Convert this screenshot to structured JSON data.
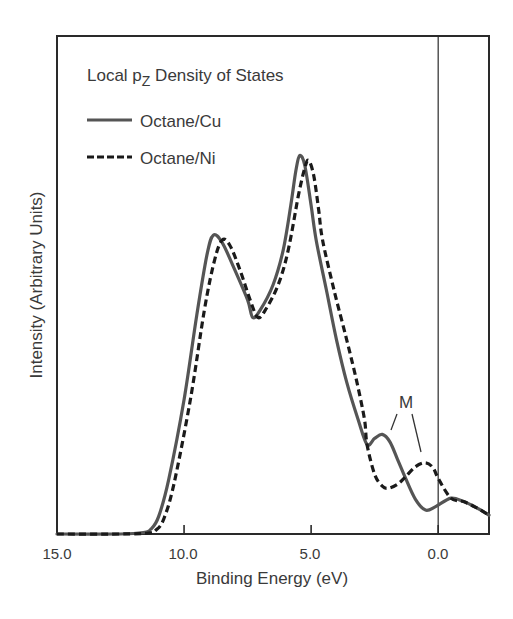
{
  "chart_data": {
    "type": "line",
    "title": "",
    "xlabel": "Binding Energy (eV)",
    "ylabel": "Intensity (Arbitrary Units)",
    "xlim": [
      15.0,
      -2.0
    ],
    "ylim": [
      0,
      100
    ],
    "x_reversed": true,
    "xticks": [
      15.0,
      10.0,
      5.0,
      0.0
    ],
    "xtick_labels": [
      "15.0",
      "10.0",
      "5.0",
      "0.0"
    ],
    "yticks": [],
    "grid": false,
    "legend": {
      "title": "Local p",
      "title_subscript": "Z",
      "title_suffix": " Density of States",
      "position": "upper left",
      "entries": [
        "Octane/Cu",
        "Octane/Ni"
      ]
    },
    "reference_lines": [
      {
        "axis": "x",
        "value": 0.0,
        "label": "Fermi level"
      }
    ],
    "annotations": [
      {
        "text": "M",
        "x": 1.6,
        "y": 27,
        "points_to": [
          {
            "x": 2.2,
            "y": 20
          },
          {
            "x": 0.5,
            "y": 14
          }
        ]
      }
    ],
    "series": [
      {
        "name": "Octane/Cu",
        "style": "solid",
        "color": "#555555",
        "x": [
          15.0,
          12.5,
          11.6,
          11.3,
          11.0,
          10.6,
          10.0,
          9.5,
          9.1,
          8.85,
          8.5,
          8.0,
          7.5,
          7.3,
          7.0,
          6.5,
          6.1,
          5.8,
          5.6,
          5.45,
          5.25,
          5.0,
          4.8,
          4.4,
          4.0,
          3.6,
          3.15,
          2.8,
          2.5,
          2.2,
          1.9,
          1.6,
          1.3,
          0.9,
          0.5,
          0.1,
          -0.5,
          -1.0,
          -1.5,
          -2.0
        ],
        "y": [
          0.0,
          0.0,
          0.3,
          1.0,
          3.5,
          11.0,
          27.0,
          44.0,
          56.0,
          60.0,
          58.5,
          53.0,
          47.0,
          43.5,
          45.0,
          50.0,
          57.0,
          66.0,
          73.0,
          76.0,
          74.0,
          66.0,
          59.0,
          49.0,
          39.0,
          30.5,
          23.0,
          18.0,
          19.2,
          20.0,
          18.5,
          15.0,
          11.4,
          7.0,
          4.8,
          5.5,
          7.2,
          6.5,
          5.3,
          3.8
        ]
      },
      {
        "name": "Octane/Ni",
        "style": "dashed",
        "color": "#1a1a1a",
        "x": [
          15.0,
          12.5,
          11.4,
          11.1,
          10.8,
          10.4,
          9.75,
          9.2,
          8.8,
          8.5,
          8.2,
          7.8,
          7.4,
          7.1,
          6.8,
          6.3,
          5.9,
          5.5,
          5.25,
          5.1,
          4.9,
          4.7,
          4.55,
          4.1,
          3.6,
          3.2,
          2.9,
          2.8,
          2.5,
          2.2,
          1.95,
          1.6,
          1.3,
          0.9,
          0.5,
          0.2,
          0.0,
          -0.5,
          -1.0,
          -1.5,
          -2.0
        ],
        "y": [
          0.0,
          0.0,
          0.2,
          0.8,
          3.0,
          10.0,
          27.0,
          45.0,
          55.0,
          59.0,
          58.0,
          53.0,
          47.0,
          43.5,
          45.0,
          50.0,
          57.0,
          68.0,
          73.5,
          75.0,
          72.0,
          65.0,
          59.0,
          49.0,
          39.0,
          30.5,
          23.0,
          18.0,
          12.0,
          9.6,
          9.2,
          10.0,
          11.4,
          13.5,
          14.3,
          13.3,
          11.2,
          7.2,
          6.5,
          5.3,
          3.8
        ]
      }
    ]
  },
  "axes": {
    "xlabel": "Binding Energy (eV)",
    "ylabel": "Intensity (Arbitrary Units)",
    "xtick_labels": [
      "15.0",
      "10.0",
      "5.0",
      "0.0"
    ]
  },
  "legend": {
    "title_main": "Local p",
    "title_sub": "Z",
    "title_rest": " Density of States",
    "entries": [
      "Octane/Cu",
      "Octane/Ni"
    ]
  },
  "annotation": {
    "label": "M"
  }
}
